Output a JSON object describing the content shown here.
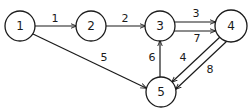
{
  "diagram": {
    "type": "directed-weighted-graph",
    "nodes": [
      {
        "id": "1",
        "label": "1",
        "x": 20,
        "y": 26,
        "r": 15
      },
      {
        "id": "2",
        "label": "2",
        "x": 91,
        "y": 26,
        "r": 15
      },
      {
        "id": "3",
        "label": "3",
        "x": 160,
        "y": 26,
        "r": 15
      },
      {
        "id": "4",
        "label": "4",
        "x": 231,
        "y": 26,
        "r": 16
      },
      {
        "id": "5",
        "label": "5",
        "x": 161,
        "y": 92,
        "r": 15
      }
    ],
    "edges": [
      {
        "from": "1",
        "to": "2",
        "weight": "1",
        "x1": 35,
        "y1": 26,
        "x2": 76,
        "y2": 26,
        "lx": 55,
        "ly": 18
      },
      {
        "from": "2",
        "to": "3",
        "weight": "2",
        "x1": 106,
        "y1": 26,
        "x2": 145,
        "y2": 26,
        "lx": 125,
        "ly": 18
      },
      {
        "from": "3",
        "to": "4",
        "weight": "3",
        "x1": 174,
        "y1": 22,
        "x2": 215,
        "y2": 22,
        "lx": 196,
        "ly": 13
      },
      {
        "from": "3",
        "to": "4",
        "weight": "7",
        "x1": 174,
        "y1": 31,
        "x2": 215,
        "y2": 31,
        "lx": 197,
        "ly": 38
      },
      {
        "from": "1",
        "to": "5",
        "weight": "5",
        "x1": 33,
        "y1": 34,
        "x2": 146,
        "y2": 88,
        "lx": 104,
        "ly": 57
      },
      {
        "from": "5",
        "to": "3",
        "weight": "6",
        "x1": 160,
        "y1": 77,
        "x2": 160,
        "y2": 41,
        "lx": 152,
        "ly": 57
      },
      {
        "from": "4",
        "to": "5",
        "weight": "4",
        "x1": 220,
        "y1": 37,
        "x2": 172,
        "y2": 82,
        "lx": 183,
        "ly": 57
      },
      {
        "from": "4",
        "to": "5",
        "weight": "8",
        "x1": 227,
        "y1": 41,
        "x2": 176,
        "y2": 89,
        "lx": 210,
        "ly": 69
      }
    ]
  }
}
